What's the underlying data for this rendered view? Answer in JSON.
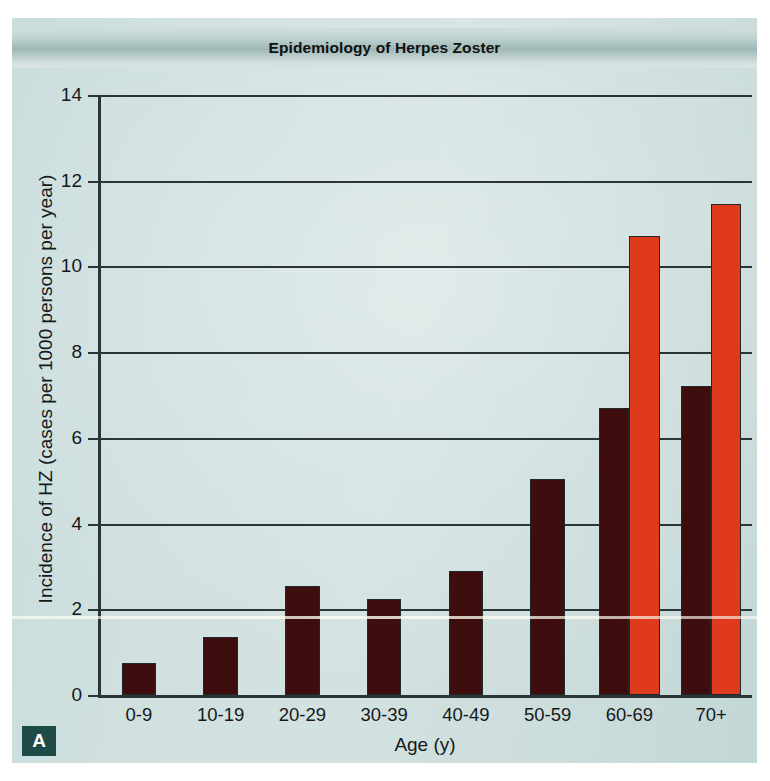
{
  "figure": {
    "panel_letter": "A",
    "background_color": "#cfe0df",
    "frame_color": "#2b3436"
  },
  "chart_data": {
    "type": "bar",
    "title": "Epidemiology of Herpes Zoster",
    "xlabel": "Age (y)",
    "ylabel": "Incidence of HZ (cases per 1000 persons per year)",
    "categories": [
      "0-9",
      "10-19",
      "20-29",
      "30-39",
      "40-49",
      "50-59",
      "60-69",
      "70+"
    ],
    "yticks": [
      0,
      2,
      4,
      6,
      8,
      10,
      12,
      14
    ],
    "ylim": [
      0,
      14
    ],
    "grid": true,
    "legend": "none",
    "series": [
      {
        "name": "dark-series",
        "color": "#3e0d0d",
        "values": [
          0.75,
          1.35,
          2.55,
          2.25,
          2.9,
          5.05,
          6.7,
          7.2
        ]
      },
      {
        "name": "red-series",
        "color": "#e03a1c",
        "values": [
          null,
          null,
          null,
          null,
          null,
          null,
          10.7,
          11.45
        ]
      }
    ]
  }
}
